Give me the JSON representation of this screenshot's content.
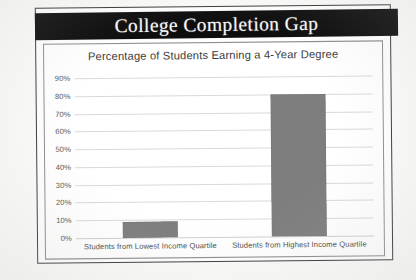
{
  "slide": {
    "title": "College Completion Gap"
  },
  "chart_data": {
    "type": "bar",
    "title": "Percentage of Students Earning a 4-Year Degree",
    "xlabel": "",
    "ylabel": "",
    "categories": [
      "Students from Lowest Income Quartile",
      "Students from Highest Income Quartile"
    ],
    "values": [
      9,
      80
    ],
    "value_labels": [
      "9%",
      "80%"
    ],
    "ylim": [
      0,
      90
    ],
    "ytick_values": [
      0,
      10,
      20,
      30,
      40,
      50,
      60,
      70,
      80,
      90
    ],
    "ytick_labels": [
      "0%",
      "10%",
      "20%",
      "30%",
      "40%",
      "50%",
      "60%",
      "70%",
      "80%",
      "90%"
    ],
    "grid": true,
    "legend": false,
    "bar_color": "#7e7e7e",
    "gridline_color": "#d9d9d9"
  },
  "colors": {
    "banner_background": "#0d0d0d",
    "banner_text": "#f7f7f7",
    "page_background": "#ffffff",
    "frame_border": "#3a3a3a",
    "chart_border": "#8e8e8e"
  }
}
